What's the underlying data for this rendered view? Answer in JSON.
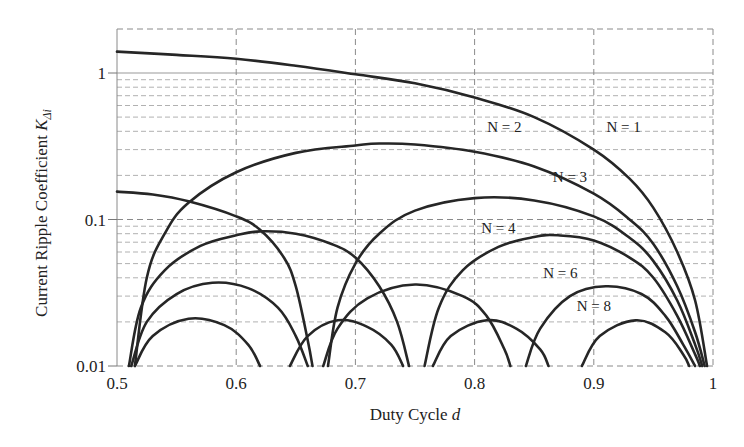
{
  "chart_data": {
    "type": "line",
    "title": "",
    "xlabel": "Duty Cycle d",
    "xlabel_main": "Duty Cycle ",
    "xlabel_var": "d",
    "ylabel": "Current Ripple Coefficient K_Δi",
    "ylabel_main": "Current Ripple Coefficient ",
    "ylabel_var": "K",
    "ylabel_sub": "Δi",
    "xlim": [
      0.5,
      1.0
    ],
    "ylim": [
      0.01,
      2.0
    ],
    "yscale": "log",
    "grid": true,
    "x_ticks": [
      0.5,
      0.6,
      0.7,
      0.8,
      0.9,
      1.0
    ],
    "x_tick_labels": [
      "0.5",
      "0.6",
      "0.7",
      "0.8",
      "0.9",
      "1"
    ],
    "y_ticks": [
      0.01,
      0.1,
      1
    ],
    "y_tick_labels": [
      "0.01",
      "0.1",
      "1"
    ],
    "legend": "inline labels",
    "series": [
      {
        "name": "N = 1",
        "label": "N = 1",
        "label_pos": [
          0.925,
          0.43
        ],
        "segments": [
          [
            [
              0.5,
              1.4
            ],
            [
              0.55,
              1.33
            ],
            [
              0.6,
              1.25
            ],
            [
              0.65,
              1.12
            ],
            [
              0.7,
              0.98
            ],
            [
              0.75,
              0.85
            ],
            [
              0.8,
              0.68
            ],
            [
              0.85,
              0.5
            ],
            [
              0.9,
              0.3
            ],
            [
              0.93,
              0.19
            ],
            [
              0.95,
              0.12
            ],
            [
              0.97,
              0.06
            ],
            [
              0.985,
              0.028
            ],
            [
              0.995,
              0.01
            ]
          ]
        ]
      },
      {
        "name": "N = 2",
        "label": "N = 2",
        "label_pos": [
          0.825,
          0.425
        ],
        "segments": [
          [
            [
              0.515,
              0.01
            ],
            [
              0.525,
              0.04
            ],
            [
              0.54,
              0.08
            ],
            [
              0.56,
              0.13
            ],
            [
              0.6,
              0.21
            ],
            [
              0.65,
              0.285
            ],
            [
              0.7,
              0.32
            ],
            [
              0.72,
              0.33
            ],
            [
              0.75,
              0.325
            ],
            [
              0.8,
              0.29
            ],
            [
              0.85,
              0.23
            ],
            [
              0.9,
              0.15
            ],
            [
              0.93,
              0.1
            ],
            [
              0.95,
              0.068
            ],
            [
              0.97,
              0.035
            ],
            [
              0.985,
              0.017
            ],
            [
              0.993,
              0.01
            ]
          ]
        ]
      },
      {
        "name": "N = 3",
        "label": "N = 3",
        "label_pos": [
          0.88,
          0.195
        ],
        "segments": [
          [
            [
              0.5,
              0.155
            ],
            [
              0.53,
              0.148
            ],
            [
              0.56,
              0.133
            ],
            [
              0.6,
              0.105
            ],
            [
              0.62,
              0.085
            ],
            [
              0.64,
              0.055
            ],
            [
              0.65,
              0.035
            ],
            [
              0.66,
              0.015
            ],
            [
              0.664,
              0.01
            ]
          ],
          [
            [
              0.677,
              0.01
            ],
            [
              0.685,
              0.025
            ],
            [
              0.7,
              0.05
            ],
            [
              0.72,
              0.08
            ],
            [
              0.75,
              0.115
            ],
            [
              0.8,
              0.14
            ],
            [
              0.85,
              0.135
            ],
            [
              0.9,
              0.105
            ],
            [
              0.93,
              0.075
            ],
            [
              0.95,
              0.052
            ],
            [
              0.97,
              0.028
            ],
            [
              0.985,
              0.014
            ],
            [
              0.991,
              0.01
            ]
          ]
        ]
      },
      {
        "name": "N = 4",
        "label": "N = 4",
        "label_pos": [
          0.82,
          0.087
        ],
        "segments": [
          [
            [
              0.51,
              0.01
            ],
            [
              0.52,
              0.025
            ],
            [
              0.54,
              0.045
            ],
            [
              0.57,
              0.066
            ],
            [
              0.6,
              0.078
            ],
            [
              0.62,
              0.083
            ],
            [
              0.65,
              0.08
            ],
            [
              0.68,
              0.068
            ],
            [
              0.7,
              0.055
            ],
            [
              0.72,
              0.035
            ],
            [
              0.735,
              0.02
            ],
            [
              0.745,
              0.01
            ]
          ],
          [
            [
              0.758,
              0.01
            ],
            [
              0.77,
              0.025
            ],
            [
              0.79,
              0.045
            ],
            [
              0.82,
              0.065
            ],
            [
              0.85,
              0.076
            ],
            [
              0.87,
              0.078
            ],
            [
              0.9,
              0.072
            ],
            [
              0.93,
              0.055
            ],
            [
              0.95,
              0.04
            ],
            [
              0.97,
              0.022
            ],
            [
              0.985,
              0.012
            ],
            [
              0.989,
              0.01
            ]
          ]
        ]
      },
      {
        "name": "N = 6",
        "label": "N = 6",
        "label_pos": [
          0.872,
          0.043
        ],
        "segments": [
          [
            [
              0.512,
              0.01
            ],
            [
              0.525,
              0.02
            ],
            [
              0.55,
              0.031
            ],
            [
              0.58,
              0.037
            ],
            [
              0.61,
              0.034
            ],
            [
              0.635,
              0.025
            ],
            [
              0.65,
              0.016
            ],
            [
              0.66,
              0.01
            ]
          ],
          [
            [
              0.673,
              0.01
            ],
            [
              0.685,
              0.018
            ],
            [
              0.71,
              0.029
            ],
            [
              0.75,
              0.036
            ],
            [
              0.79,
              0.03
            ],
            [
              0.81,
              0.022
            ],
            [
              0.825,
              0.013
            ],
            [
              0.83,
              0.01
            ]
          ],
          [
            [
              0.843,
              0.01
            ],
            [
              0.855,
              0.018
            ],
            [
              0.88,
              0.03
            ],
            [
              0.91,
              0.035
            ],
            [
              0.94,
              0.031
            ],
            [
              0.96,
              0.022
            ],
            [
              0.975,
              0.014
            ],
            [
              0.985,
              0.01
            ]
          ]
        ]
      },
      {
        "name": "N = 8",
        "label": "N = 8",
        "label_pos": [
          0.9,
          0.0255
        ],
        "segments": [
          [
            [
              0.515,
              0.01
            ],
            [
              0.53,
              0.016
            ],
            [
              0.56,
              0.021
            ],
            [
              0.59,
              0.019
            ],
            [
              0.61,
              0.014
            ],
            [
              0.62,
              0.01
            ]
          ],
          [
            [
              0.645,
              0.01
            ],
            [
              0.66,
              0.016
            ],
            [
              0.685,
              0.0205
            ],
            [
              0.71,
              0.0185
            ],
            [
              0.73,
              0.014
            ],
            [
              0.74,
              0.01
            ]
          ],
          [
            [
              0.765,
              0.01
            ],
            [
              0.78,
              0.016
            ],
            [
              0.81,
              0.0205
            ],
            [
              0.835,
              0.018
            ],
            [
              0.855,
              0.013
            ],
            [
              0.862,
              0.01
            ]
          ],
          [
            [
              0.89,
              0.01
            ],
            [
              0.905,
              0.016
            ],
            [
              0.935,
              0.0205
            ],
            [
              0.96,
              0.017
            ],
            [
              0.975,
              0.012
            ],
            [
              0.98,
              0.01
            ]
          ]
        ]
      }
    ]
  }
}
